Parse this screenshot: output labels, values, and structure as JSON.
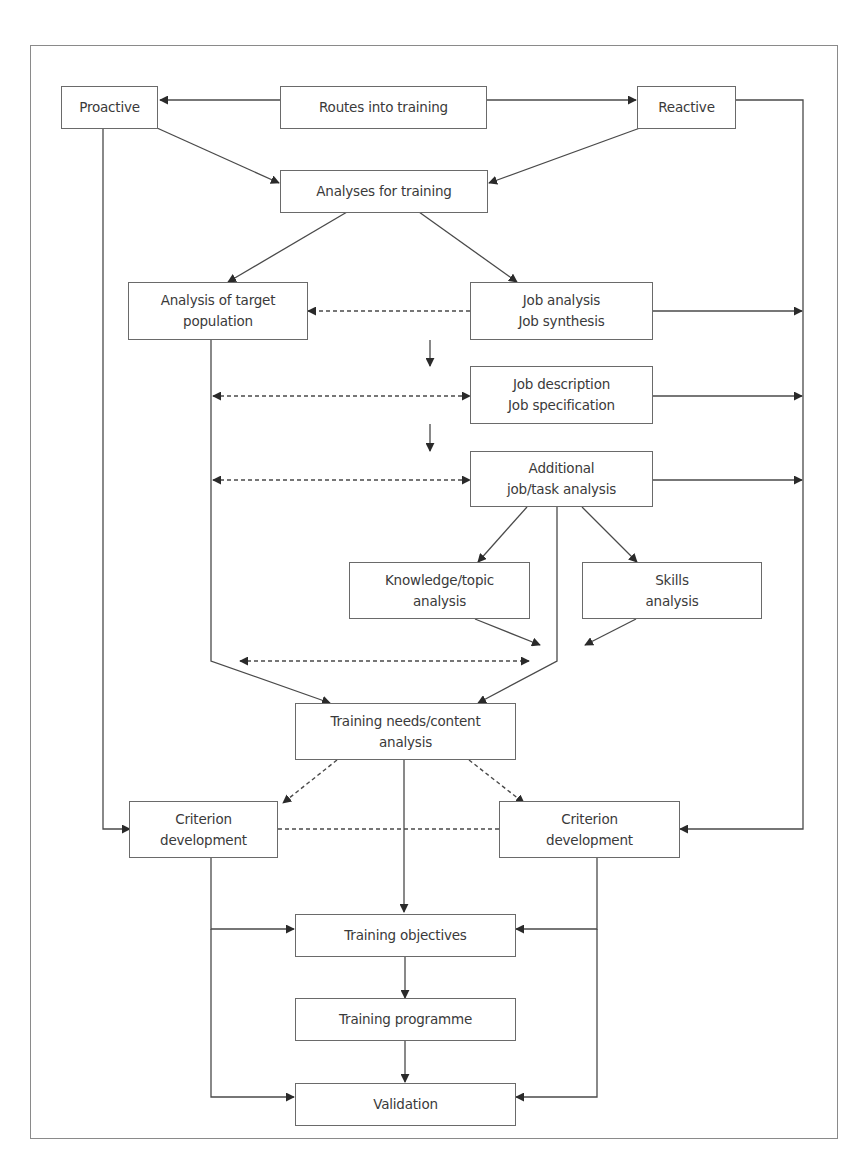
{
  "diagram": {
    "type": "flowchart",
    "nodes": {
      "routes": {
        "label": "Routes into training"
      },
      "proactive": {
        "label": "Proactive"
      },
      "reactive": {
        "label": "Reactive"
      },
      "analyses": {
        "label": "Analyses for training"
      },
      "target_population": {
        "label": "Analysis of target\npopulation"
      },
      "job_analysis": {
        "label": "Job analysis\nJob synthesis"
      },
      "job_description": {
        "label": "Job description\nJob specification"
      },
      "additional": {
        "label": "Additional\njob/task analysis"
      },
      "knowledge": {
        "label": "Knowledge/topic\nanalysis"
      },
      "skills": {
        "label": "Skills\nanalysis"
      },
      "training_needs": {
        "label": "Training needs/content\nanalysis"
      },
      "criterion_left": {
        "label": "Criterion\ndevelopment"
      },
      "criterion_right": {
        "label": "Criterion\ndevelopment"
      },
      "objectives": {
        "label": "Training objectives"
      },
      "programme": {
        "label": "Training programme"
      },
      "validation": {
        "label": "Validation"
      }
    },
    "edges": [
      {
        "from": "routes",
        "to": "proactive",
        "style": "solid"
      },
      {
        "from": "routes",
        "to": "reactive",
        "style": "solid"
      },
      {
        "from": "proactive",
        "to": "analyses",
        "style": "solid"
      },
      {
        "from": "reactive",
        "to": "analyses",
        "style": "solid"
      },
      {
        "from": "analyses",
        "to": "target_population",
        "style": "solid"
      },
      {
        "from": "analyses",
        "to": "job_analysis",
        "style": "solid"
      },
      {
        "from": "job_analysis",
        "to": "target_population",
        "style": "dashed"
      },
      {
        "from": "job_analysis",
        "to": "job_description",
        "style": "solid"
      },
      {
        "from": "job_description",
        "to": "additional",
        "style": "solid"
      },
      {
        "from": "target_population",
        "to": "job_description",
        "style": "dashed-bidirectional"
      },
      {
        "from": "target_population",
        "to": "additional",
        "style": "dashed-bidirectional"
      },
      {
        "from": "additional",
        "to": "knowledge",
        "style": "solid"
      },
      {
        "from": "additional",
        "to": "skills",
        "style": "solid"
      },
      {
        "from": "knowledge",
        "to": "training_needs",
        "style": "solid"
      },
      {
        "from": "skills",
        "to": "training_needs",
        "style": "solid"
      },
      {
        "from": "target_population",
        "to": "training_needs",
        "style": "solid"
      },
      {
        "from": "additional",
        "to": "training_needs",
        "style": "solid"
      },
      {
        "from": "target_population",
        "to": "additional",
        "style": "dashed-bidirectional"
      },
      {
        "from": "training_needs",
        "to": "criterion_left",
        "style": "dashed"
      },
      {
        "from": "training_needs",
        "to": "criterion_right",
        "style": "dashed"
      },
      {
        "from": "training_needs",
        "to": "objectives",
        "style": "solid"
      },
      {
        "from": "criterion_left",
        "to": "criterion_right",
        "style": "dashed"
      },
      {
        "from": "proactive",
        "to": "criterion_left",
        "style": "solid"
      },
      {
        "from": "reactive",
        "to": "criterion_right",
        "style": "solid"
      },
      {
        "from": "job_analysis",
        "to": "reactive_rail",
        "style": "solid"
      },
      {
        "from": "job_description",
        "to": "reactive_rail",
        "style": "solid"
      },
      {
        "from": "additional",
        "to": "reactive_rail",
        "style": "solid"
      },
      {
        "from": "criterion_left",
        "to": "objectives",
        "style": "solid"
      },
      {
        "from": "criterion_right",
        "to": "objectives",
        "style": "solid"
      },
      {
        "from": "objectives",
        "to": "programme",
        "style": "solid"
      },
      {
        "from": "programme",
        "to": "validation",
        "style": "solid"
      },
      {
        "from": "criterion_left",
        "to": "validation",
        "style": "solid"
      },
      {
        "from": "criterion_right",
        "to": "validation",
        "style": "solid"
      }
    ],
    "colors": {
      "line": "#4a4a4a",
      "border": "#6a6a6a",
      "text": "#3a3a3a",
      "frame": "#8a8a8a"
    }
  }
}
